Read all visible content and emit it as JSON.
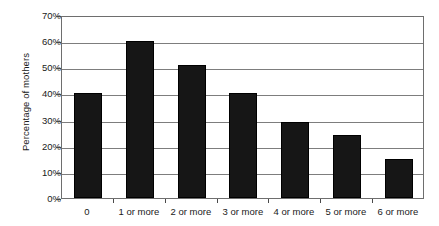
{
  "chart_data": {
    "type": "bar",
    "title": "",
    "subtitle": "",
    "xlabel": "",
    "ylabel": "Percentage of mothers",
    "categories": [
      "0",
      "1 or more",
      "2 or more",
      "3 or more",
      "4 or more",
      "5 or more",
      "6 or more"
    ],
    "values": [
      40,
      60,
      51,
      40,
      29,
      24,
      15
    ],
    "value_labels": [
      "40%",
      "60%",
      "51%",
      "40%",
      "29%",
      "24%",
      "15%"
    ],
    "ylim": [
      0,
      70
    ],
    "ytick_values": [
      0,
      10,
      20,
      30,
      40,
      50,
      60,
      70
    ],
    "ytick_labels": [
      "0%",
      "10%",
      "20%",
      "30%",
      "40%",
      "50%",
      "60%",
      "70%"
    ],
    "grid": true,
    "grid_axis": "y",
    "legend": false,
    "legend_position": "none",
    "series": [
      {
        "name": "Percentage of mothers",
        "values": [
          40,
          60,
          51,
          40,
          29,
          24,
          15
        ],
        "color": "#161616"
      }
    ],
    "colors": {
      "bar": "#161616",
      "bar_edge": "#000000",
      "gridline": "#7d7d7d",
      "axis": "#6e6e6e",
      "text": "#1a1a1a",
      "background": "#ffffff"
    }
  }
}
